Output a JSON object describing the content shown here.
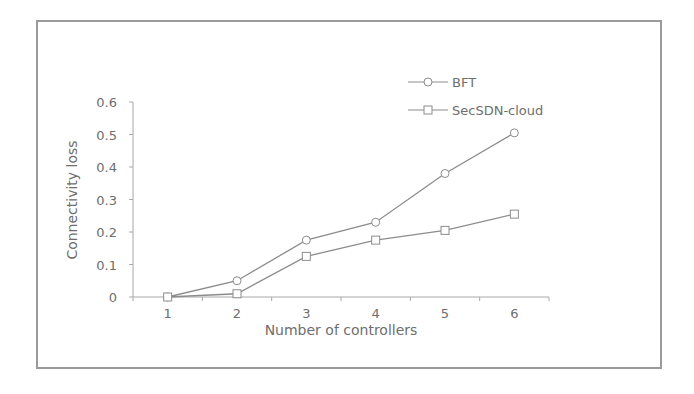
{
  "chart_data": {
    "type": "line",
    "title": "",
    "xlabel": "Number of controllers",
    "ylabel": "Connectivity loss",
    "categories": [
      "1",
      "2",
      "3",
      "4",
      "5",
      "6"
    ],
    "x": [
      1,
      2,
      3,
      4,
      5,
      6
    ],
    "series": [
      {
        "name": "BFT",
        "marker": "circle",
        "values": [
          0,
          0.05,
          0.175,
          0.23,
          0.38,
          0.505
        ]
      },
      {
        "name": "SecSDN-cloud",
        "marker": "square",
        "values": [
          0,
          0.01,
          0.125,
          0.175,
          0.205,
          0.255
        ]
      }
    ],
    "ylim": [
      0,
      0.6
    ],
    "yticks": [
      "0",
      "0.1",
      "0.2",
      "0.3",
      "0.4",
      "0.5",
      "0.6"
    ],
    "grid": false,
    "legend_position": "upper right (inside plot)",
    "line_color": "#8c8c8c"
  },
  "legend": {
    "items": [
      {
        "label": "BFT",
        "icon": "circle-marker-icon"
      },
      {
        "label": "SecSDN-cloud",
        "icon": "square-marker-icon"
      }
    ]
  },
  "axes": {
    "x_title": "Number of controllers",
    "y_title": "Connectivity loss",
    "x_ticks": [
      "1",
      "2",
      "3",
      "4",
      "5",
      "6"
    ],
    "y_ticks": [
      "0",
      "0.1",
      "0.2",
      "0.3",
      "0.4",
      "0.5",
      "0.6"
    ]
  }
}
